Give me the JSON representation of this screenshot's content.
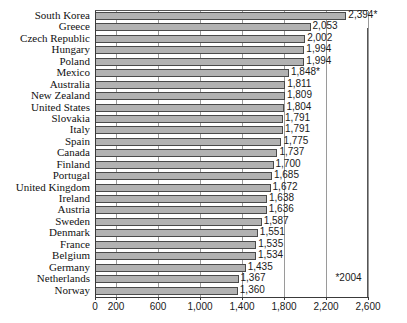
{
  "chart_data": {
    "type": "bar",
    "orientation": "horizontal",
    "title": "",
    "subtitle": "",
    "xlabel": "",
    "ylabel": "",
    "xlim": [
      0,
      2600
    ],
    "ylim": null,
    "grid": true,
    "legend": null,
    "xticks": [
      0,
      200,
      600,
      1000,
      1400,
      1800,
      2200,
      2600
    ],
    "xtick_labels": [
      "0",
      "200",
      "600",
      "1,000",
      "1,400",
      "1,800",
      "2,200",
      "2,600"
    ],
    "categories": [
      "South Korea",
      "Greece",
      "Czech Republic",
      "Hungary",
      "Poland",
      "Mexico",
      "Australia",
      "New Zealand",
      "United States",
      "Slovakia",
      "Italy",
      "Spain",
      "Canada",
      "Finland",
      "Portugal",
      "United Kingdom",
      "Ireland",
      "Austria",
      "Sweden",
      "Denmark",
      "France",
      "Belgium",
      "Germany",
      "Netherlands",
      "Norway"
    ],
    "values": [
      2394,
      2053,
      2002,
      1994,
      1994,
      1848,
      1811,
      1809,
      1804,
      1791,
      1791,
      1775,
      1737,
      1700,
      1685,
      1672,
      1638,
      1636,
      1587,
      1551,
      1535,
      1534,
      1435,
      1367,
      1360
    ],
    "data_labels": [
      "2,394*",
      "2,053",
      "2,002",
      "1,994",
      "1,994",
      "1,848*",
      "1,811",
      "1,809",
      "1,804",
      "1,791",
      "1,791",
      "1,775",
      "1,737",
      "1,700",
      "1,685",
      "1,672",
      "1,638",
      "1,636",
      "1,587",
      "1,551",
      "1,535",
      "1,534",
      "1,435",
      "1,367",
      "1,360"
    ],
    "annotations": [
      {
        "text": "*2004",
        "x": 2290,
        "y_row": 23
      }
    ],
    "colors": {
      "bar_fill": "#b2b2b2",
      "bar_border": "#4a4a4a",
      "gridline": "#9a9a9a",
      "axis": "#3a3a3a",
      "text": "#1a1a1a",
      "background": "#ffffff"
    }
  }
}
